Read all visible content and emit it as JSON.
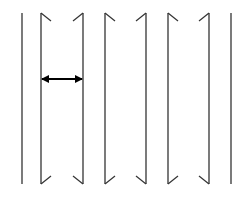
{
  "diagram": {
    "stroke_color": "#333333",
    "background": "#ffffff",
    "line_top": 13,
    "line_bottom": 184,
    "hook_size": 10,
    "lines": [
      {
        "x": 22,
        "hooks": "none"
      },
      {
        "x": 41,
        "hooks": "inward-right"
      },
      {
        "x": 83,
        "hooks": "inward-left"
      },
      {
        "x": 105,
        "hooks": "inward-right"
      },
      {
        "x": 146,
        "hooks": "inward-left"
      },
      {
        "x": 168,
        "hooks": "inward-right"
      },
      {
        "x": 209,
        "hooks": "inward-left"
      },
      {
        "x": 231,
        "hooks": "none"
      }
    ],
    "arrow": {
      "x1": 41,
      "x2": 83,
      "y": 79,
      "type": "double-headed",
      "color": "#000000"
    }
  }
}
